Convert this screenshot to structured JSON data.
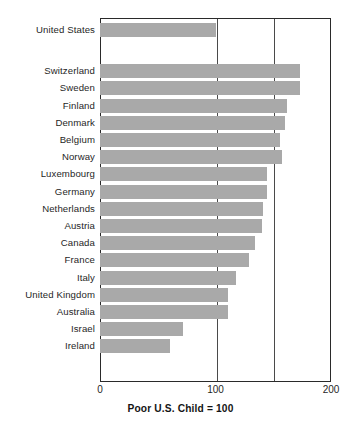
{
  "chart_data": {
    "type": "bar",
    "orientation": "horizontal",
    "title": "",
    "subtitle": "",
    "xlabel": "Poor U.S. Child = 100",
    "ylabel": "",
    "xlim": [
      0,
      200
    ],
    "xticks": [
      0,
      100,
      200
    ],
    "xtick_labels": [
      "0",
      "100",
      "200"
    ],
    "gridlines": [
      100,
      150
    ],
    "grid": true,
    "legend": null,
    "reference_value": 100,
    "reference_label": "Poor U.S. Child = 100",
    "bar_color": "#a9a9a9",
    "axis_color": "#2a2a2a",
    "categories": [
      "United States",
      "Switzerland",
      "Sweden",
      "Finland",
      "Denmark",
      "Belgium",
      "Norway",
      "Luxembourg",
      "Germany",
      "Netherlands",
      "Austria",
      "Canada",
      "France",
      "Italy",
      "United Kingdom",
      "Australia",
      "Israel",
      "Ireland"
    ],
    "values": [
      100,
      173,
      173,
      162,
      160,
      156,
      158,
      145,
      145,
      141,
      140,
      134,
      129,
      118,
      111,
      111,
      72,
      61
    ],
    "group_break_after_index": 0
  },
  "axis": {
    "title": "Poor U.S. Child = 100",
    "tick_0": "0",
    "tick_100": "100",
    "tick_200": "200"
  }
}
